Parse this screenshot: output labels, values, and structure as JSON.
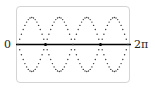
{
  "chart_data": {
    "type": "line",
    "title": "",
    "xlabel": "",
    "ylabel": "",
    "x_ticks": [
      "0",
      "2π"
    ],
    "xlim": [
      0,
      6.2832
    ],
    "series": [
      {
        "name": "upper dotted curve",
        "style": "dotted",
        "function": "sin(4x)"
      },
      {
        "name": "lower dotted curve",
        "style": "dotted",
        "function": "-sin(4x)"
      }
    ],
    "marked_points": [
      {
        "x_fraction": 0.25,
        "y": 0
      },
      {
        "x_fraction": 0.75,
        "y": 0
      }
    ],
    "grid": false,
    "legend": null
  },
  "labels": {
    "left": "0",
    "right": "2π"
  },
  "colors": {
    "axis": "#000000",
    "dots": "#333333",
    "frame": "#d4d4d4"
  }
}
